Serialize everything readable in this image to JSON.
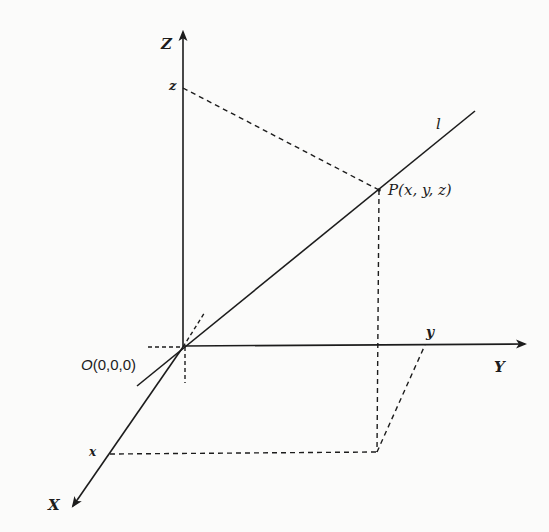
{
  "figure": {
    "colors": {
      "ink": "#1c1c1c",
      "background": "#fbfbfa"
    },
    "axes": {
      "z_axis": {
        "label": "Z"
      },
      "y_axis": {
        "label": "Y"
      },
      "x_axis": {
        "label": "X"
      }
    },
    "origin": {
      "label_letter": "O",
      "label_coords": "(0,0,0)"
    },
    "point": {
      "label": "P(x, y, z)"
    },
    "line": {
      "label": "l"
    },
    "projections": {
      "z_tick": "z",
      "y_tick": "y",
      "x_tick": "x"
    }
  }
}
